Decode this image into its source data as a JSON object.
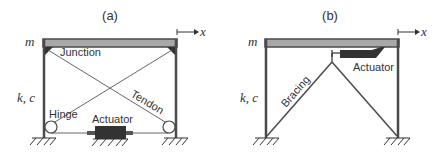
{
  "panel_a": {
    "title": "(a)",
    "mass_label": "m",
    "stiffness_label": "k, c",
    "x_label": "x",
    "labels": {
      "junction": "Junction",
      "tendon": "Tendon",
      "hinge": "Hinge",
      "actuator": "Actuator"
    }
  },
  "panel_b": {
    "title": "(b)",
    "mass_label": "m",
    "stiffness_label": "k, c",
    "x_label": "x",
    "labels": {
      "bracing": "Bracing",
      "actuator": "Actuator"
    }
  },
  "colors": {
    "frame": "#4a4a4a",
    "beam_fill": "#a8a8a8",
    "actuator": "#333333",
    "text": "#333333"
  }
}
